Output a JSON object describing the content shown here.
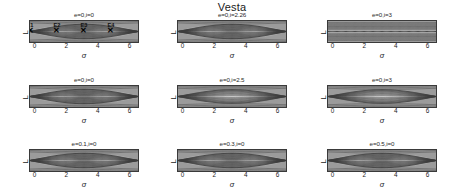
{
  "figure": {
    "title": "Vesta",
    "xlabel": "σ",
    "ylabel": "L"
  },
  "chart_data": {
    "type": "line",
    "title": "Vesta",
    "xlabel": "σ",
    "ylabel": "L",
    "xlim": [
      -0.35,
      6.6
    ],
    "xticks": [
      "0",
      "2",
      "4",
      "6"
    ],
    "xtick_values": [
      0,
      2,
      4,
      6
    ],
    "grid": false,
    "legend": "none",
    "panels": [
      {
        "id": "p1",
        "row": 1,
        "col": 1,
        "title": "e=0,i=0",
        "eccentricity": 0,
        "inclination": 0,
        "ylim": [
          92,
          105
        ],
        "yticks": [
          "105",
          "92"
        ],
        "ytick_values": [
          105,
          92
        ],
        "topology": "double-island (two resonant islands) with separatrix figure-eight",
        "equilibria": [
          {
            "label": "E1",
            "sigma": 0.0,
            "L": 97.8,
            "type": "unstable"
          },
          {
            "label": "E2",
            "sigma": 1.57,
            "L": 97.8,
            "type": "stable"
          },
          {
            "label": "E3",
            "sigma": 3.14,
            "L": 97.8,
            "type": "unstable"
          },
          {
            "label": "E4",
            "sigma": 4.71,
            "L": 97.8,
            "type": "stable"
          }
        ]
      },
      {
        "id": "p2",
        "row": 1,
        "col": 2,
        "title": "e=0,i=2.26",
        "eccentricity": 0,
        "inclination": 2.26,
        "ylim": [
          96,
          99
        ],
        "yticks": [
          "99",
          "96"
        ],
        "ytick_values": [
          99,
          96
        ],
        "topology": "double-island, narrower separatrix",
        "equilibria": [
          {
            "label": "",
            "sigma": 1.57,
            "L": 97.5,
            "type": "stable"
          },
          {
            "label": "",
            "sigma": 4.71,
            "L": 97.5,
            "type": "stable"
          }
        ]
      },
      {
        "id": "p3",
        "row": 1,
        "col": 3,
        "title": "e=0,i=3",
        "eccentricity": 0,
        "inclination": 3,
        "ylim": [
          98.6,
          99.2
        ],
        "yticks": [
          "99.2",
          "98.6"
        ],
        "ytick_values": [
          99.2,
          98.6
        ],
        "topology": "flattened, islands nearly degenerate into a thin band",
        "equilibria": []
      },
      {
        "id": "p4",
        "row": 2,
        "col": 1,
        "title": "e=0,i=0",
        "eccentricity": 0,
        "inclination": 0,
        "ylim": [
          92,
          105
        ],
        "yticks": [
          "105",
          "92"
        ],
        "ytick_values": [
          105,
          92
        ],
        "topology": "double-island (two resonant islands) with separatrix figure-eight",
        "equilibria": [
          {
            "label": "",
            "sigma": 1.57,
            "L": 97.8,
            "type": "stable"
          },
          {
            "label": "",
            "sigma": 4.71,
            "L": 97.8,
            "type": "stable"
          }
        ]
      },
      {
        "id": "p5",
        "row": 2,
        "col": 2,
        "title": "e=0,i=2.5",
        "eccentricity": 0,
        "inclination": 2.5,
        "ylim": [
          96.5,
          99.5
        ],
        "yticks": [
          "99.5",
          "96.5"
        ],
        "ytick_values": [
          99.5,
          96.5
        ],
        "topology": "single broad island centered near sigma=3.14",
        "equilibria": [
          {
            "label": "",
            "sigma": 3.14,
            "L": 98.1,
            "type": "stable"
          }
        ]
      },
      {
        "id": "p6",
        "row": 2,
        "col": 3,
        "title": "e=0,i=3",
        "eccentricity": 0,
        "inclination": 3,
        "ylim": [
          98.6,
          99.3
        ],
        "yticks": [
          "99.3",
          "98.6"
        ],
        "ytick_values": [
          99.3,
          98.6
        ],
        "topology": "single lens-shaped island centered near sigma=3.14",
        "equilibria": [
          {
            "label": "",
            "sigma": 3.14,
            "L": 98.95,
            "type": "stable"
          }
        ]
      },
      {
        "id": "p7",
        "row": 3,
        "col": 1,
        "title": "e=0.1,i=0",
        "eccentricity": 0.1,
        "inclination": 0,
        "ylim": [
          92,
          105
        ],
        "yticks": [
          "105",
          "92"
        ],
        "ytick_values": [
          105,
          92
        ],
        "topology": "double-island with widened separatrix",
        "equilibria": [
          {
            "label": "",
            "sigma": 1.57,
            "L": 97.8,
            "type": "stable"
          },
          {
            "label": "",
            "sigma": 4.71,
            "L": 97.8,
            "type": "stable"
          }
        ]
      },
      {
        "id": "p8",
        "row": 3,
        "col": 2,
        "title": "e=0.3,i=0",
        "eccentricity": 0.3,
        "inclination": 0,
        "ylim": [
          92,
          105
        ],
        "yticks": [
          "105",
          "92"
        ],
        "ytick_values": [
          105,
          92
        ],
        "topology": "double-island, islands broadened by eccentricity",
        "equilibria": [
          {
            "label": "",
            "sigma": 1.57,
            "L": 97.8,
            "type": "stable"
          },
          {
            "label": "",
            "sigma": 4.71,
            "L": 97.8,
            "type": "stable"
          }
        ]
      },
      {
        "id": "p9",
        "row": 3,
        "col": 3,
        "title": "e=0.5,i=0",
        "eccentricity": 0.5,
        "inclination": 0,
        "ylim": [
          92,
          105
        ],
        "yticks": [
          "105",
          "92"
        ],
        "ytick_values": [
          105,
          92
        ],
        "topology": "double-island, large islands with thick separatrix band",
        "equilibria": [
          {
            "label": "",
            "sigma": 1.57,
            "L": 98.6,
            "type": "stable"
          },
          {
            "label": "",
            "sigma": 4.71,
            "L": 98.6,
            "type": "stable"
          }
        ]
      }
    ]
  }
}
